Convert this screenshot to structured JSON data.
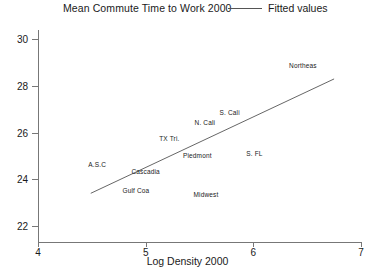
{
  "chart_data": {
    "type": "scatter",
    "title": "Mean Commute Time to Work 2000",
    "xlabel": "Log Density 2000",
    "ylabel": "",
    "xlim": [
      4,
      7
    ],
    "ylim": [
      21.3,
      30.4
    ],
    "grid": false,
    "legend_position": "top-right",
    "legend": [
      {
        "label": "Fitted values",
        "marker": "line",
        "color": "#555555"
      }
    ],
    "xticks": [
      4,
      5,
      6,
      7
    ],
    "xtick_labels": [
      "4",
      "5",
      "6",
      "7"
    ],
    "yticks": [
      22,
      24,
      26,
      28,
      30
    ],
    "ytick_labels": [
      "22",
      "24",
      "26",
      "28",
      "30"
    ],
    "points": [
      {
        "label": "Northeas",
        "x": 6.46,
        "y": 28.88
      },
      {
        "label": "S. Cali",
        "x": 5.78,
        "y": 26.86
      },
      {
        "label": "N. Cali",
        "x": 5.55,
        "y": 26.43
      },
      {
        "label": "TX Tri.",
        "x": 5.22,
        "y": 25.78
      },
      {
        "label": "S. FL",
        "x": 6.01,
        "y": 25.14
      },
      {
        "label": "Piedmont",
        "x": 5.48,
        "y": 25.02
      },
      {
        "label": "A.S.C",
        "x": 4.55,
        "y": 24.63
      },
      {
        "label": "Cascadia",
        "x": 5.0,
        "y": 24.33
      },
      {
        "label": "Gulf Coa",
        "x": 4.91,
        "y": 23.52
      },
      {
        "label": "Midwest",
        "x": 5.56,
        "y": 23.34
      }
    ],
    "fitted_line": {
      "name": "Fitted values",
      "x": [
        4.49,
        6.75
      ],
      "y": [
        23.39,
        28.3
      ],
      "color": "#555555"
    }
  }
}
